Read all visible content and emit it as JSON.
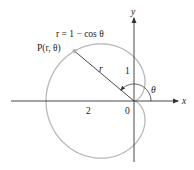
{
  "figure": {
    "equation_label": "r = 1 − cos θ",
    "point_label": "P(r, θ)",
    "radius_label": "r",
    "angle_label": "θ",
    "x_axis_label": "x",
    "y_axis_label": "y",
    "tick_labels": {
      "x_two": "2",
      "origin": "0",
      "y_one": "1"
    },
    "colors": {
      "curve": "#b8b8b8",
      "axes": "#333333",
      "point": "#b0b0b0",
      "text": "#222222"
    }
  },
  "chart_data": {
    "type": "polar-curve",
    "title": "",
    "equation": "r = 1 - cos(theta)",
    "curve_name": "cardioid",
    "theta_range": [
      0,
      6.2832
    ],
    "point_P": {
      "theta_deg": 140,
      "r": 1.766,
      "label": "P(r, θ)"
    },
    "axis_ticks": {
      "x": [
        {
          "value": -2,
          "label": "2"
        },
        {
          "value": 0,
          "label": "0"
        }
      ],
      "y": [
        {
          "value": 1,
          "label": "1"
        }
      ]
    },
    "xlabel": "x",
    "ylabel": "y",
    "xlim": [
      -2.8,
      1.3
    ],
    "ylim": [
      -1.55,
      2.3
    ],
    "grid": false
  }
}
